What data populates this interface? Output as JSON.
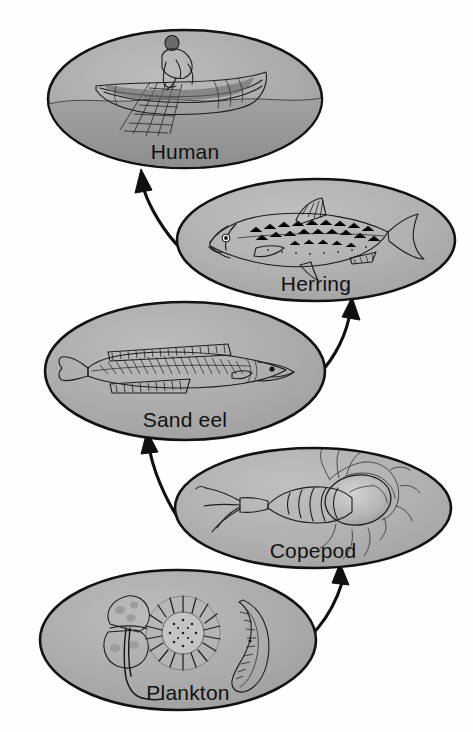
{
  "diagram": {
    "type": "food-chain",
    "canvas": {
      "width": 473,
      "height": 732
    },
    "style": {
      "ellipse_fill": "#a9a9a9",
      "ellipse_fill_light": "#bdbdbd",
      "ellipse_stroke": "#121212",
      "background": "#ffffff",
      "label_color": "#111111",
      "arrow_color": "#0f0f0f"
    },
    "nodes": [
      {
        "id": "human",
        "label": "Human",
        "icon": "fisherman-in-boat-icon",
        "cx": 185,
        "cy": 99,
        "rx": 137,
        "ry": 69,
        "label_x": 185,
        "label_y": 159
      },
      {
        "id": "herring",
        "label": "Herring",
        "icon": "herring-fish-icon",
        "cx": 316,
        "cy": 240,
        "rx": 139,
        "ry": 61,
        "label_x": 316,
        "label_y": 291
      },
      {
        "id": "sandeel",
        "label": "Sand eel",
        "icon": "sand-eel-fish-icon",
        "cx": 185,
        "cy": 371,
        "rx": 140,
        "ry": 69,
        "label_x": 185,
        "label_y": 427
      },
      {
        "id": "copepod",
        "label": "Copepod",
        "icon": "copepod-crustacean-icon",
        "cx": 313,
        "cy": 508,
        "rx": 138,
        "ry": 60,
        "label_x": 313,
        "label_y": 558
      },
      {
        "id": "plankton",
        "label": "Plankton",
        "icon": "plankton-organisms-icon",
        "cx": 178,
        "cy": 640,
        "rx": 138,
        "ry": 70,
        "label_x": 188,
        "label_y": 700
      }
    ],
    "arrows": [
      {
        "id": "plankton-to-copepod",
        "from": "plankton",
        "to": "copepod",
        "label": "eaten by"
      },
      {
        "id": "copepod-to-sandeel",
        "from": "copepod",
        "to": "sandeel",
        "label": "eaten by"
      },
      {
        "id": "sandeel-to-herring",
        "from": "sandeel",
        "to": "herring",
        "label": "eaten by"
      },
      {
        "id": "herring-to-human",
        "from": "herring",
        "to": "human",
        "label": "eaten by"
      }
    ],
    "chain_order": [
      "Plankton",
      "Copepod",
      "Sand eel",
      "Herring",
      "Human"
    ]
  }
}
